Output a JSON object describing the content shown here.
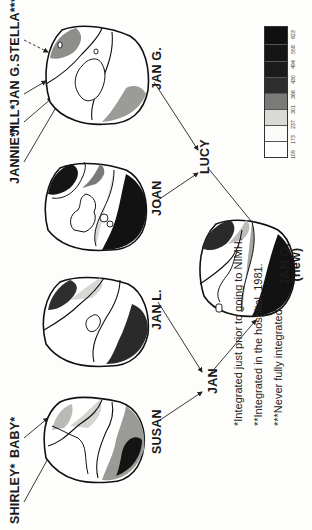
{
  "figure": {
    "top_labels": {
      "shirley": "SHIRLEY*",
      "baby": "BABY*",
      "jannie": "JANNIE**",
      "jill": "JILL*",
      "jan_g_top": "JAN G.",
      "stella": "STELLA***"
    },
    "maps": [
      {
        "id": "susan",
        "label": "SUSAN"
      },
      {
        "id": "jan_l",
        "label": "JAN L."
      },
      {
        "id": "joan",
        "label": "JOAN"
      },
      {
        "id": "jan_g",
        "label": "JAN G."
      },
      {
        "id": "jan_g_new",
        "label": "JAN G.",
        "sublabel": "(new)"
      }
    ],
    "integration_nodes": {
      "jan": "JAN",
      "lucy": "LUCY"
    },
    "footnotes": [
      "*Integrated just prior to going to NIMH.",
      "**Integrated in the hospital, 1981.",
      "***Never fully integrated."
    ],
    "legend": {
      "ticks": [
        "109",
        "173",
        "237",
        "301",
        "366",
        "430",
        "494",
        "558",
        "623"
      ],
      "colors": [
        "#ffffff",
        "#f7f7f5",
        "#d9d9d6",
        "#7a7a78",
        "#2e2e2e",
        "#1e1e1e",
        "#161616",
        "#111111"
      ]
    }
  }
}
